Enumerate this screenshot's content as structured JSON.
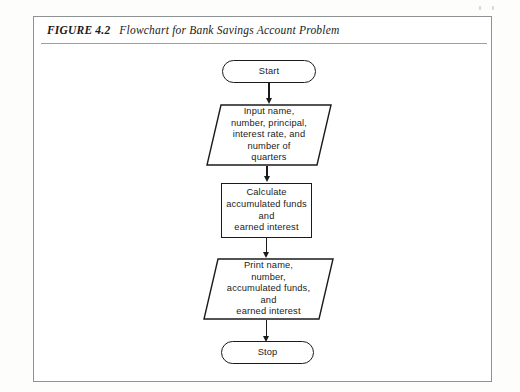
{
  "figure": {
    "label": "FIGURE 4.2",
    "title": "Flowchart for Bank Savings Account Problem"
  },
  "colors": {
    "ink": "#1b1b1b",
    "frame": "#8e9295",
    "rule": "#9aa0a3",
    "page": "#ffffff"
  },
  "flowchart": {
    "type": "flowchart",
    "orientation": "top-to-bottom",
    "nodes": [
      {
        "id": "start",
        "shape": "terminator",
        "label": "Start"
      },
      {
        "id": "input",
        "shape": "parallelogram",
        "label": "Input name,\nnumber, principal,\ninterest rate, and\nnumber of\nquarters"
      },
      {
        "id": "calculate",
        "shape": "rectangle",
        "label": "Calculate\naccumulated funds\nand\nearned interest"
      },
      {
        "id": "print",
        "shape": "parallelogram",
        "label": "Print name,\nnumber,\naccumulated funds,\nand\nearned interest"
      },
      {
        "id": "stop",
        "shape": "terminator",
        "label": "Stop"
      }
    ],
    "edges": [
      {
        "from": "start",
        "to": "input",
        "arrow": "down"
      },
      {
        "from": "input",
        "to": "calculate",
        "arrow": "down"
      },
      {
        "from": "calculate",
        "to": "print",
        "arrow": "down"
      },
      {
        "from": "print",
        "to": "stop",
        "arrow": "down"
      }
    ]
  }
}
